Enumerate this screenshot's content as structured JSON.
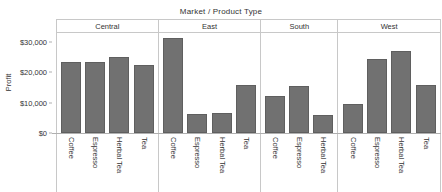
{
  "chart_data": {
    "type": "bar",
    "title": "Market  /  Product Type",
    "xlabel": "",
    "ylabel": "Profit",
    "ylim": [
      0,
      33000
    ],
    "yticks": [
      0,
      10000,
      20000,
      30000
    ],
    "ytick_labels": [
      "$0",
      "$10,000",
      "$20,000",
      "$30,000"
    ],
    "grid": false,
    "legend": "none",
    "orientation": "vertical",
    "bar_color": "#717171",
    "panel_groups": "Market",
    "categories": [
      "Coffee",
      "Espresso",
      "Herbal Tea",
      "Tea"
    ],
    "panels": [
      {
        "name": "Central",
        "categories": [
          "Coffee",
          "Espresso",
          "Herbal Tea",
          "Tea"
        ],
        "values": [
          23300,
          23600,
          25000,
          22400
        ]
      },
      {
        "name": "East",
        "categories": [
          "Coffee",
          "Espresso",
          "Herbal Tea",
          "Tea"
        ],
        "values": [
          31400,
          6200,
          6500,
          16000
        ]
      },
      {
        "name": "South",
        "categories": [
          "Coffee",
          "Espresso",
          "Herbal Tea"
        ],
        "values": [
          12200,
          15500,
          6100
        ]
      },
      {
        "name": "West",
        "categories": [
          "Coffee",
          "Espresso",
          "Herbal Tea",
          "Tea"
        ],
        "values": [
          9500,
          24500,
          27200,
          16000
        ]
      }
    ]
  },
  "axis": {
    "y_title": "Profit"
  }
}
